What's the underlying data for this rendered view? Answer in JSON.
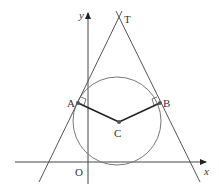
{
  "diagram": {
    "type": "geometry",
    "labels": {
      "y_axis": "y",
      "x_axis": "x",
      "origin": "O",
      "point_T": "T",
      "point_A": "A",
      "point_B": "B",
      "point_C": "C"
    },
    "colors": {
      "line": "#555555",
      "radius": "#222222",
      "point": "#555555"
    }
  }
}
